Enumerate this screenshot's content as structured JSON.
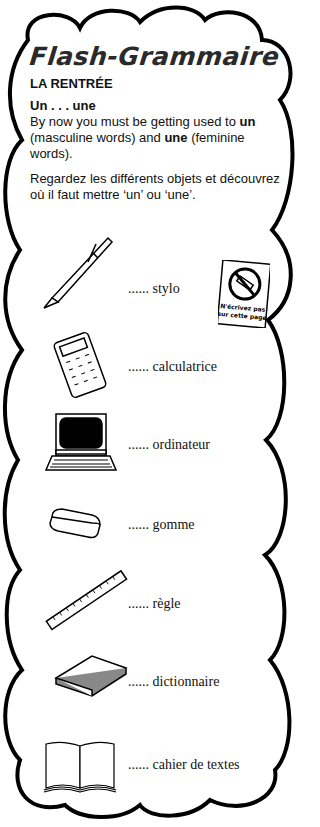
{
  "title": "Flash-Grammaire",
  "subtitle": "LA RENTRÉE",
  "intro": {
    "heading": "Un . . . une",
    "line1_pre": "By now you must be getting used to ",
    "line1_bold1": "un",
    "line1_mid": " (masculine words) and ",
    "line1_bold2": "une",
    "line1_post": " (feminine words).",
    "instruction": "Regardez les différents objets et découvrez où il faut mettre ‘un’ ou ‘une’."
  },
  "stamp": {
    "text_line1": "N'écrivez pas",
    "text_line2": "sur cette page",
    "icon": "no-writing-icon"
  },
  "blank": "......",
  "items": [
    {
      "word": "stylo",
      "icon": "pen-icon"
    },
    {
      "word": "calculatrice",
      "icon": "calculator-icon"
    },
    {
      "word": "ordinateur",
      "icon": "computer-icon"
    },
    {
      "word": "gomme",
      "icon": "eraser-icon"
    },
    {
      "word": "règle",
      "icon": "ruler-icon"
    },
    {
      "word": "dictionnaire",
      "icon": "book-icon"
    },
    {
      "word": "cahier de textes",
      "icon": "open-notebook-icon"
    }
  ]
}
